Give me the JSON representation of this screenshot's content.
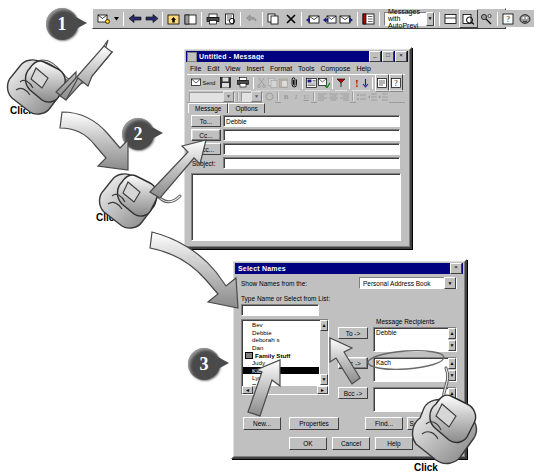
{
  "outlook_toolbar": {
    "name": "Microsoft Outlook main toolbar",
    "view_combo_value": "Messages with AutoPrevi",
    "buttons": [
      {
        "name": "new-mail-message",
        "icon": "new-mail-icon",
        "label": "New Mail Message"
      },
      {
        "name": "new-mail-dropdown",
        "icon": "chevron-down-icon",
        "label": ""
      },
      {
        "name": "back",
        "icon": "arrow-left-icon",
        "label": "Back"
      },
      {
        "name": "forward",
        "icon": "arrow-right-icon",
        "label": "Forward"
      },
      {
        "name": "up-one-level",
        "icon": "up-folder-icon",
        "label": "Up One Level"
      },
      {
        "name": "folder-list",
        "icon": "folder-list-icon",
        "label": "Folder List"
      },
      {
        "name": "print",
        "icon": "printer-icon",
        "label": "Print"
      },
      {
        "name": "print-preview",
        "icon": "print-preview-icon",
        "label": "Print Preview"
      },
      {
        "name": "undo",
        "icon": "undo-arrow-icon",
        "label": "Undo"
      },
      {
        "name": "move-to-folder",
        "icon": "copy-icon",
        "label": "Move to Folder"
      },
      {
        "name": "delete",
        "icon": "delete-x-icon",
        "label": "Delete"
      },
      {
        "name": "reply",
        "icon": "reply-icon",
        "label": "Reply"
      },
      {
        "name": "reply-to-all",
        "icon": "reply-all-icon",
        "label": "Reply to All"
      },
      {
        "name": "forward-message",
        "icon": "forward-message-icon",
        "label": "Forward"
      },
      {
        "name": "address-book",
        "icon": "address-book-icon",
        "label": "Address Book"
      },
      {
        "name": "preview-pane",
        "icon": "preview-pane-icon",
        "label": "Preview Pane"
      },
      {
        "name": "find-items",
        "icon": "find-magnifier-icon",
        "label": "Find Items"
      },
      {
        "name": "organize",
        "icon": "organize-icon",
        "label": "Organize"
      },
      {
        "name": "help",
        "icon": "question-mark-icon",
        "label": "Microsoft Outlook Help"
      },
      {
        "name": "office-assistant",
        "icon": "office-assistant-icon",
        "label": "Office Assistant"
      }
    ]
  },
  "message_window": {
    "title": "Untitled - Message",
    "title_buttons": [
      "_",
      "□",
      "×"
    ],
    "menu": [
      "File",
      "Edit",
      "View",
      "Insert",
      "Format",
      "Tools",
      "Compose",
      "Help"
    ],
    "toolbar_send_label": "Send",
    "font_combo_value": "",
    "tabs": [
      {
        "name": "tab-message",
        "label": "Message",
        "active": true
      },
      {
        "name": "tab-options",
        "label": "Options",
        "active": false
      }
    ],
    "fields": [
      {
        "name": "to-button",
        "button": "To...",
        "value": "Debbie"
      },
      {
        "name": "cc-button",
        "button": "Cc...",
        "value": ""
      },
      {
        "name": "bcc-button",
        "button": "Bcc...",
        "value": ""
      }
    ],
    "subject_label": "Subject:",
    "subject_value": "",
    "body_value": ""
  },
  "select_names": {
    "title": "Select Names",
    "close_label": "×",
    "show_names_label": "Show Names from the:",
    "address_book_value": "Personal Address Book",
    "type_name_label": "Type Name or Select from List:",
    "type_name_value": "",
    "list_items": [
      {
        "label": "Bev",
        "bold": false,
        "selected": false,
        "group": false
      },
      {
        "label": "Debbie",
        "bold": false,
        "selected": false,
        "group": false
      },
      {
        "label": "deborah s",
        "bold": false,
        "selected": false,
        "group": false
      },
      {
        "label": "Dan",
        "bold": false,
        "selected": false,
        "group": false
      },
      {
        "label": "Family Stuff",
        "bold": true,
        "selected": false,
        "group": true
      },
      {
        "label": "Judy",
        "bold": false,
        "selected": false,
        "group": false
      },
      {
        "label": "Kach",
        "bold": false,
        "selected": true,
        "group": false
      },
      {
        "label": "Lyn",
        "bold": false,
        "selected": false,
        "group": false
      },
      {
        "label": "Rich Martin",
        "bold": false,
        "selected": false,
        "group": false
      },
      {
        "label": "Steve",
        "bold": false,
        "selected": false,
        "group": false
      }
    ],
    "recipients_label": "Message Recipients",
    "to_button": "To ->",
    "cc_button": "Cc ->",
    "bcc_button": "Bcc ->",
    "to_value": "Debbie",
    "cc_value": "Kach",
    "bcc_value": "",
    "bottom_buttons": [
      {
        "name": "new-button",
        "label": "New..."
      },
      {
        "name": "properties-button",
        "label": "Properties"
      },
      {
        "name": "find-button",
        "label": "Find..."
      },
      {
        "name": "send-options-button",
        "label": "Send Options..."
      }
    ],
    "action_buttons": [
      {
        "name": "ok-button",
        "label": "OK"
      },
      {
        "name": "cancel-button",
        "label": "Cancel"
      },
      {
        "name": "help-button",
        "label": "Help"
      }
    ]
  },
  "callouts": [
    {
      "name": "callout-step-1",
      "number": "1",
      "click_label": "Click"
    },
    {
      "name": "callout-step-2",
      "number": "2",
      "click_label": "Click"
    },
    {
      "name": "callout-step-3",
      "number": "3",
      "click_label": "Click"
    }
  ]
}
